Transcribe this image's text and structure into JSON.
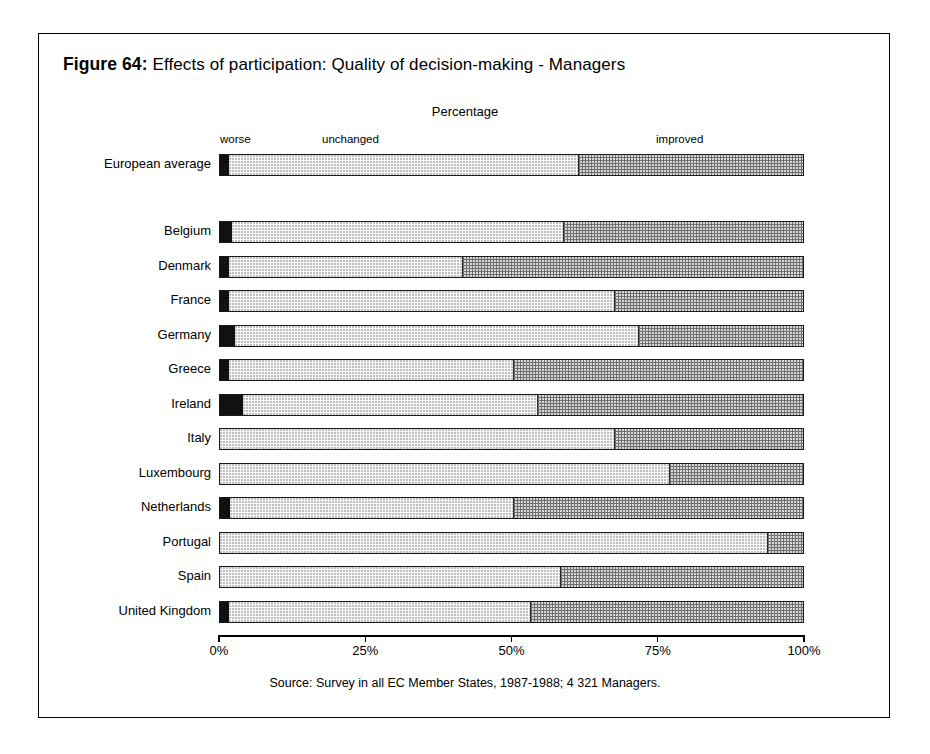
{
  "figure": {
    "label": "Figure 64:",
    "caption": "Effects of participation: Quality of decision-making - Managers",
    "axis_title": "Percentage",
    "source": "Source: Survey in all EC Member States, 1987-1988; 4 321 Managers."
  },
  "legend": {
    "worse": "worse",
    "unchanged": "unchanged",
    "improved": "improved"
  },
  "axis": {
    "ticks": [
      {
        "label": "0%",
        "value": 0
      },
      {
        "label": "25%",
        "value": 25
      },
      {
        "label": "50%",
        "value": 50
      },
      {
        "label": "75%",
        "value": 75
      },
      {
        "label": "100%",
        "value": 100
      }
    ]
  },
  "rows": [
    {
      "label": "European average",
      "worse": 1.5,
      "unchanged": 60.0,
      "improved": 38.5,
      "group": "average"
    },
    {
      "label": "Belgium",
      "worse": 2.0,
      "unchanged": 57.0,
      "improved": 41.0,
      "group": "country"
    },
    {
      "label": "Denmark",
      "worse": 1.5,
      "unchanged": 40.2,
      "improved": 58.3,
      "group": "country"
    },
    {
      "label": "France",
      "worse": 1.5,
      "unchanged": 66.2,
      "improved": 32.3,
      "group": "country"
    },
    {
      "label": "Germany",
      "worse": 2.5,
      "unchanged": 69.3,
      "improved": 28.2,
      "group": "country"
    },
    {
      "label": "Greece",
      "worse": 1.5,
      "unchanged": 48.9,
      "improved": 49.6,
      "group": "country"
    },
    {
      "label": "Ireland",
      "worse": 4.0,
      "unchanged": 50.5,
      "improved": 45.5,
      "group": "country"
    },
    {
      "label": "Italy",
      "worse": 0.0,
      "unchanged": 67.7,
      "improved": 32.3,
      "group": "country"
    },
    {
      "label": "Luxembourg",
      "worse": 0.0,
      "unchanged": 77.1,
      "improved": 22.9,
      "group": "country"
    },
    {
      "label": "Netherlands",
      "worse": 1.8,
      "unchanged": 48.6,
      "improved": 49.6,
      "group": "country"
    },
    {
      "label": "Portugal",
      "worse": 0.0,
      "unchanged": 94.0,
      "improved": 6.0,
      "group": "country"
    },
    {
      "label": "Spain",
      "worse": 0.0,
      "unchanged": 58.5,
      "improved": 41.5,
      "group": "country"
    },
    {
      "label": "United Kingdom",
      "worse": 1.5,
      "unchanged": 51.8,
      "improved": 46.7,
      "group": "country"
    }
  ],
  "chart_data": {
    "type": "bar",
    "orientation": "horizontal",
    "stacked": true,
    "title": "Figure 64: Effects of participation: Quality of decision-making - Managers",
    "xlabel": "Percentage",
    "ylabel": "",
    "xlim": [
      0,
      100
    ],
    "xticks": [
      0,
      25,
      50,
      75,
      100
    ],
    "xticklabels": [
      "0%",
      "25%",
      "50%",
      "75%",
      "100%"
    ],
    "grid": false,
    "legend_position": "top",
    "legend_entries": [
      "worse",
      "unchanged",
      "improved"
    ],
    "categories": [
      "European average",
      "Belgium",
      "Denmark",
      "France",
      "Germany",
      "Greece",
      "Ireland",
      "Italy",
      "Luxembourg",
      "Netherlands",
      "Portugal",
      "Spain",
      "United Kingdom"
    ],
    "series": [
      {
        "name": "worse",
        "values": [
          1.5,
          2.0,
          1.5,
          1.5,
          2.5,
          1.5,
          4.0,
          0.0,
          0.0,
          1.8,
          0.0,
          0.0,
          1.5
        ]
      },
      {
        "name": "unchanged",
        "values": [
          60.0,
          57.0,
          40.2,
          66.2,
          69.3,
          48.9,
          50.5,
          67.7,
          77.1,
          48.6,
          94.0,
          58.5,
          51.8
        ]
      },
      {
        "name": "improved",
        "values": [
          38.5,
          41.0,
          58.3,
          32.3,
          28.2,
          49.6,
          45.5,
          32.3,
          22.9,
          49.6,
          6.0,
          41.5,
          46.7
        ]
      }
    ],
    "annotations": [
      "Source: Survey in all EC Member States, 1987-1988; 4 321 Managers."
    ]
  }
}
